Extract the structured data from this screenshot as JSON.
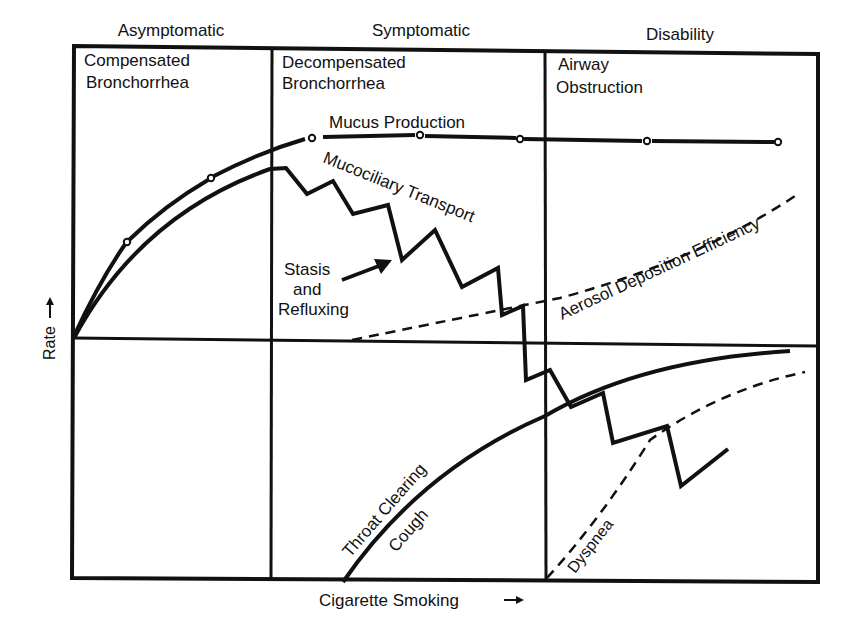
{
  "phases": [
    {
      "label": "Asymptomatic",
      "stage_line1": "Compensated",
      "stage_line2": "Bronchorrhea"
    },
    {
      "label": "Symptomatic",
      "stage_line1": "Decompensated",
      "stage_line2": "Bronchorrhea"
    },
    {
      "label": "Disability",
      "stage_line1": "Airway",
      "stage_line2": "Obstruction"
    }
  ],
  "axes": {
    "x_label": "Cigarette Smoking",
    "x_arrow": "→",
    "y_label": "Rate",
    "y_arrow": "→"
  },
  "curves": {
    "mucus_production": "Mucus Production",
    "mucociliary_transport": "Mucociliary Transport",
    "aerosol_deposition": "Aerosol Deposition Efficiency",
    "throat_clearing_line1": "Throat Clearing",
    "throat_clearing_line2": "Cough",
    "dyspnea": "Dyspnea"
  },
  "annotation": {
    "line1": "Stasis",
    "line2": "and",
    "line3": "Refluxing"
  },
  "colors": {
    "ink": "#111111",
    "background": "#ffffff"
  }
}
